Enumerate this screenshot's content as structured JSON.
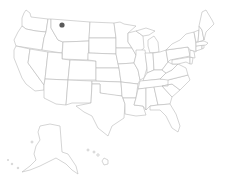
{
  "map": {
    "title": "United States",
    "background": "#ffffff",
    "state_fill": "#ffffff",
    "state_stroke": "#b8b8b8",
    "regions": [
      "contiguous-us",
      "alaska",
      "hawaii"
    ]
  },
  "markers": [
    {
      "label": "location-marker",
      "region": "Montana",
      "x": 62,
      "y": 25,
      "color": "#5a5a5a"
    }
  ]
}
